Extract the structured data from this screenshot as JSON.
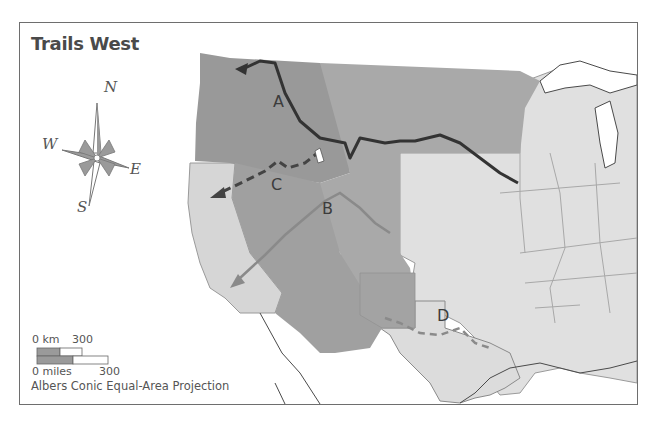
{
  "map": {
    "title": "Trails West",
    "trails": [
      {
        "id": "A",
        "label": "A",
        "style": "solid",
        "color": "#333333"
      },
      {
        "id": "B",
        "label": "B",
        "style": "solid",
        "color": "#8a8a8a"
      },
      {
        "id": "C",
        "label": "C",
        "style": "dashed",
        "color": "#444444"
      },
      {
        "id": "D",
        "label": "D",
        "style": "dashed",
        "color": "#8a8a8a"
      }
    ],
    "compass": {
      "n": "N",
      "s": "S",
      "e": "E",
      "w": "W"
    },
    "scale": {
      "km_label": "0 km",
      "km_value": "300",
      "miles_label": "0 miles",
      "miles_value": "300"
    },
    "projection": "Albers Conic Equal-Area Projection",
    "colors": {
      "region_dark": "#9a9a9a",
      "region_mid": "#a8a8a8",
      "region_light": "#d6d6d6",
      "states_east": "#e0e0e0",
      "water": "#ffffff",
      "border": "#6e6e6e"
    }
  }
}
